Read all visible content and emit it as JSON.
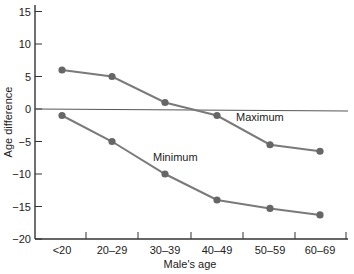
{
  "chart_data": {
    "type": "line",
    "title": "",
    "xlabel": "Male's age",
    "ylabel": "Age difference",
    "categories": [
      "<20",
      "20–29",
      "30–39",
      "40–49",
      "50–59",
      "60–69"
    ],
    "series": [
      {
        "name": "Maximum",
        "values": [
          6,
          5,
          1,
          -1,
          -5.5,
          -6.5
        ]
      },
      {
        "name": "Minimum",
        "values": [
          -1,
          -5,
          -10,
          -14,
          -15.3,
          -16.3
        ]
      }
    ],
    "yticks": [
      15,
      10,
      5,
      0,
      -5,
      -10,
      -15,
      -20
    ],
    "ylim": [
      -20,
      16
    ],
    "grid": false,
    "zero_line": true,
    "legend": "inline labels",
    "annotations": [
      {
        "text": "Maximum",
        "near": "40–49 / Maximum series"
      },
      {
        "text": "Minimum",
        "near": "30–39 / Minimum series"
      }
    ],
    "colors": {
      "line": "#7a7a7a",
      "marker": "#666666",
      "axis": "#333333"
    }
  },
  "labels": {
    "xlabel": "Male's age",
    "ylabel": "Age difference",
    "maximum": "Maximum",
    "minimum": "Minimum"
  }
}
